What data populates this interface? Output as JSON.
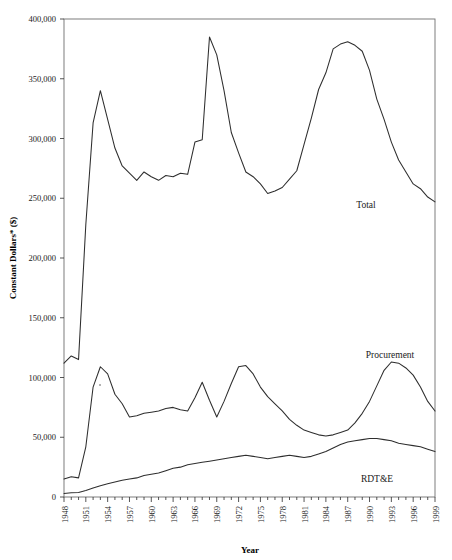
{
  "chart_data": {
    "type": "line",
    "title": "",
    "xlabel": "Year",
    "ylabel": "Constant Dollars* ($)",
    "xlim": [
      1948,
      1999
    ],
    "ylim": [
      0,
      400000
    ],
    "grid": false,
    "legend_position": "inline-annotations",
    "y_ticks": [
      0,
      50000,
      100000,
      150000,
      200000,
      250000,
      300000,
      350000,
      400000
    ],
    "y_tick_labels": [
      "0",
      "50,000",
      "100,000",
      "150,000",
      "200,000",
      "250,000",
      "300,000",
      "350,000",
      "400,000"
    ],
    "x_ticks": [
      1948,
      1951,
      1954,
      1957,
      1960,
      1963,
      1966,
      1969,
      1972,
      1975,
      1978,
      1981,
      1984,
      1987,
      1990,
      1993,
      1996,
      1999
    ],
    "x_tick_labels": [
      "1948",
      "1951",
      "1954",
      "1957",
      "1960",
      "1963",
      "1966",
      "1969",
      "1972",
      "1975",
      "1978",
      "1981",
      "1984",
      "1987",
      "1990",
      "1993",
      "1996",
      "1999"
    ],
    "x": [
      1948,
      1949,
      1950,
      1951,
      1952,
      1953,
      1954,
      1955,
      1956,
      1957,
      1958,
      1959,
      1960,
      1961,
      1962,
      1963,
      1964,
      1965,
      1966,
      1967,
      1968,
      1969,
      1970,
      1971,
      1972,
      1973,
      1974,
      1975,
      1976,
      1977,
      1978,
      1979,
      1980,
      1981,
      1982,
      1983,
      1984,
      1985,
      1986,
      1987,
      1988,
      1989,
      1990,
      1991,
      1992,
      1993,
      1994,
      1995,
      1996,
      1997,
      1998,
      1999
    ],
    "series": [
      {
        "name": "Total",
        "label": "Total",
        "values": [
          112000,
          118000,
          115000,
          228000,
          313000,
          340000,
          316000,
          292000,
          277000,
          271000,
          265000,
          272000,
          268000,
          265000,
          269000,
          268000,
          271000,
          270000,
          297000,
          299000,
          385000,
          370000,
          340000,
          305000,
          288000,
          272000,
          268000,
          262000,
          254000,
          256000,
          259000,
          266000,
          273000,
          295000,
          317000,
          341000,
          355000,
          375000,
          379000,
          381000,
          378000,
          373000,
          357000,
          333000,
          316000,
          297000,
          282000,
          272000,
          262000,
          258000,
          251000,
          247000
        ]
      },
      {
        "name": "Procurement",
        "label": "Procurement",
        "values": [
          15000,
          17000,
          16000,
          42000,
          92000,
          109000,
          103000,
          86000,
          78000,
          67000,
          68000,
          70000,
          71000,
          72000,
          74000,
          75000,
          73000,
          72000,
          83000,
          96000,
          81000,
          67000,
          80000,
          95000,
          109000,
          110000,
          103000,
          92000,
          84000,
          80000,
          77000,
          74000,
          70000,
          63000,
          57000,
          55000,
          52000,
          52000,
          53000,
          56000,
          61000,
          69000,
          78000,
          92000,
          105000,
          113000,
          112000,
          108000,
          104000,
          96000,
          86000,
          78000
        ]
      },
      {
        "name": "RDT&E",
        "label": "RDT&E",
        "values": [
          3000,
          3500,
          3800,
          5500,
          7500,
          9500,
          11000,
          12500,
          14000,
          15000,
          16000,
          18000,
          19000,
          20000,
          22000,
          24000,
          25000,
          27000,
          28000,
          29000,
          30000,
          31000,
          32000,
          33000,
          34000,
          35000,
          34000,
          33000,
          32000,
          33000,
          34000,
          35000,
          34000,
          33000,
          34000,
          36000,
          38000,
          41000,
          44000,
          46000,
          47000,
          48000,
          49000,
          49000,
          48000,
          47000,
          45000,
          44000,
          43000,
          42000,
          40000,
          38000
        ]
      }
    ],
    "procurement_plot": [
      15000,
      17000,
      16000,
      42000,
      92000,
      109000,
      103000,
      86000,
      78000,
      67000,
      68000,
      70000,
      71000,
      72000,
      74000,
      75000,
      73000,
      72000,
      83000,
      96000,
      81000,
      67000,
      80000,
      95000,
      109000,
      110000,
      103000,
      92000,
      84000,
      78000,
      72000,
      65000,
      60000,
      56000,
      54000,
      52000,
      51000,
      52000,
      54000,
      56000,
      62000,
      70000,
      80000,
      93000,
      106000,
      113000,
      112000,
      108000,
      102000,
      92000,
      80000,
      72000
    ]
  },
  "annotations": {
    "total": "Total",
    "procurement": "Procurement",
    "rdte": "RDT&E"
  },
  "axis": {
    "x_title": "Year",
    "y_title": "Constant Dollars* ($)"
  }
}
